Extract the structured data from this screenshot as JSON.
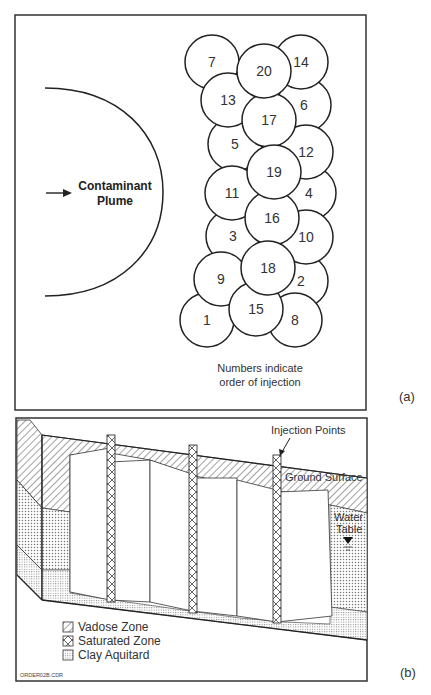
{
  "panel_a": {
    "tag": "(a)",
    "plume_label_line1": "Contaminant",
    "plume_label_line2": "Plume",
    "note_line1": "Numbers indicate",
    "note_line2": "order of injection",
    "circles": [
      {
        "n": "7",
        "cx": 212,
        "cy": 62
      },
      {
        "n": "14",
        "cx": 301,
        "cy": 62
      },
      {
        "n": "6",
        "cx": 304,
        "cy": 105
      },
      {
        "n": "12",
        "cx": 306,
        "cy": 152
      },
      {
        "n": "4",
        "cx": 309,
        "cy": 193
      },
      {
        "n": "10",
        "cx": 306,
        "cy": 237
      },
      {
        "n": "2",
        "cx": 301,
        "cy": 281
      },
      {
        "n": "8",
        "cx": 295,
        "cy": 320
      },
      {
        "n": "13",
        "cx": 228,
        "cy": 100
      },
      {
        "n": "5",
        "cx": 235,
        "cy": 144
      },
      {
        "n": "11",
        "cx": 232,
        "cy": 193
      },
      {
        "n": "3",
        "cx": 233,
        "cy": 236
      },
      {
        "n": "9",
        "cx": 221,
        "cy": 279
      },
      {
        "n": "1",
        "cx": 207,
        "cy": 320
      },
      {
        "n": "20",
        "cx": 264,
        "cy": 71
      },
      {
        "n": "17",
        "cx": 269,
        "cy": 120
      },
      {
        "n": "19",
        "cx": 274,
        "cy": 172
      },
      {
        "n": "16",
        "cx": 272,
        "cy": 218
      },
      {
        "n": "18",
        "cx": 268,
        "cy": 268
      },
      {
        "n": "15",
        "cx": 256,
        "cy": 309
      }
    ]
  },
  "panel_b": {
    "tag": "(b)",
    "injection_points_label": "Injection Points",
    "ground_surface_label": "Ground Surface",
    "water_table_line1": "Water",
    "water_table_line2": "Table",
    "legend": [
      {
        "label": "Vadose Zone",
        "pattern": "hatch"
      },
      {
        "label": "Saturated Zone",
        "pattern": "crosshatch"
      },
      {
        "label": "Clay Aquitard",
        "pattern": "dots"
      }
    ],
    "file_label": "ORDER02B.CDR"
  }
}
